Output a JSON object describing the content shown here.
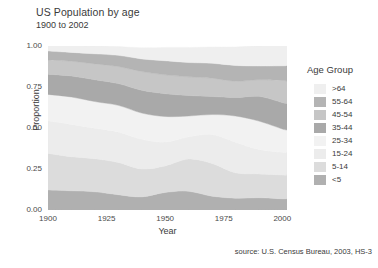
{
  "title": "US Population by age",
  "subtitle": "1900 to 2002",
  "source": "source: U.S. Census Bureau, 2003, HS-3",
  "axes": {
    "xlabel": "Year",
    "ylabel": "Proportion",
    "xticks": [
      "1900",
      "1925",
      "1950",
      "1975",
      "2000"
    ],
    "yticks": [
      "1.00",
      "0.75",
      "0.50",
      "0.25",
      "0.00"
    ]
  },
  "legend": {
    "title": "Age Group",
    "items": [
      {
        "label": ">64",
        "color": "#efefef"
      },
      {
        "label": "55-64",
        "color": "#b4b4b4"
      },
      {
        "label": "45-54",
        "color": "#c6c6c6"
      },
      {
        "label": "35-44",
        "color": "#a9a9a9"
      },
      {
        "label": "25-34",
        "color": "#f2f2f2"
      },
      {
        "label": "15-24",
        "color": "#ececec"
      },
      {
        "label": "5-14",
        "color": "#dcdcdc"
      },
      {
        "label": "<5",
        "color": "#b0b0b0"
      }
    ]
  },
  "chart_data": {
    "type": "area",
    "title": "US Population by age",
    "subtitle": "1900 to 2002",
    "xlabel": "Year",
    "ylabel": "Proportion",
    "xlim": [
      1900,
      2002
    ],
    "ylim": [
      0,
      1
    ],
    "grid": false,
    "legend_position": "right",
    "stacked": true,
    "stack_order_bottom_to_top": [
      "<5",
      "5-14",
      "15-24",
      "25-34",
      "35-44",
      "45-54",
      "55-64",
      ">64"
    ],
    "x": [
      1900,
      1910,
      1920,
      1930,
      1940,
      1950,
      1960,
      1970,
      1980,
      1990,
      2000,
      2002
    ],
    "series": [
      {
        "name": "<5",
        "color": "#b0b0b0",
        "values": [
          0.122,
          0.117,
          0.111,
          0.093,
          0.08,
          0.107,
          0.114,
          0.084,
          0.072,
          0.075,
          0.068,
          0.068
        ]
      },
      {
        "name": "5-14",
        "color": "#dcdcdc",
        "values": [
          0.223,
          0.208,
          0.202,
          0.197,
          0.17,
          0.162,
          0.197,
          0.2,
          0.155,
          0.145,
          0.145,
          0.143
        ]
      },
      {
        "name": "15-24",
        "color": "#ececec",
        "values": [
          0.199,
          0.197,
          0.186,
          0.186,
          0.181,
          0.145,
          0.135,
          0.176,
          0.186,
          0.149,
          0.139,
          0.139
        ]
      },
      {
        "name": "25-34",
        "color": "#f2f2f2",
        "values": [
          0.161,
          0.167,
          0.162,
          0.162,
          0.16,
          0.156,
          0.127,
          0.122,
          0.16,
          0.173,
          0.142,
          0.139
        ]
      },
      {
        "name": "35-44",
        "color": "#a9a9a9",
        "values": [
          0.123,
          0.128,
          0.133,
          0.133,
          0.139,
          0.139,
          0.125,
          0.11,
          0.113,
          0.151,
          0.161,
          0.159
        ]
      },
      {
        "name": "45-54",
        "color": "#c6c6c6",
        "values": [
          0.087,
          0.09,
          0.097,
          0.104,
          0.114,
          0.115,
          0.114,
          0.112,
          0.099,
          0.101,
          0.135,
          0.14
        ]
      },
      {
        "name": "55-64",
        "color": "#b4b4b4",
        "values": [
          0.054,
          0.054,
          0.061,
          0.068,
          0.077,
          0.086,
          0.087,
          0.091,
          0.096,
          0.084,
          0.089,
          0.093
        ]
      },
      {
        "name": ">64",
        "color": "#efefef",
        "values": [
          0.041,
          0.043,
          0.049,
          0.054,
          0.068,
          0.081,
          0.092,
          0.099,
          0.113,
          0.124,
          0.124,
          0.124
        ]
      }
    ]
  }
}
